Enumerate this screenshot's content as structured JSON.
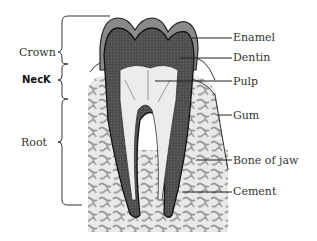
{
  "diagram": {
    "colors": {
      "enamel": "#8a8a8a",
      "dentin": "#555555",
      "pulp": "#eeeeee",
      "bone_pattern": "#9a9a9a",
      "outline": "#222222"
    },
    "left_labels": {
      "crown": "Crown",
      "neck": "NecK",
      "root": "Root"
    },
    "right_labels": {
      "enamel": "Enamel",
      "dentin": "Dentin",
      "pulp": "Pulp",
      "gum": "Gum",
      "bone": "Bone of jaw",
      "cement": "Cement"
    }
  }
}
